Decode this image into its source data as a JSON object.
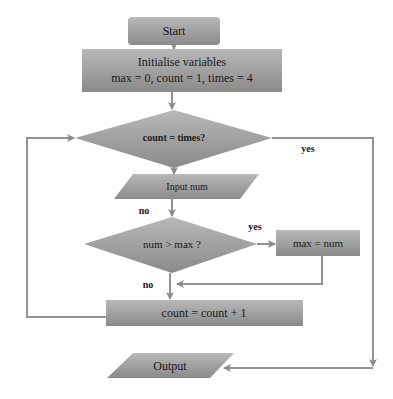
{
  "colors": {
    "shape_fill_top": "#b4b4b4",
    "shape_fill_bottom": "#8c8c8c",
    "line": "#8f8f8f",
    "text": "#1a1a1a"
  },
  "nodes": {
    "start": {
      "label": "Start",
      "shape": "rounded-rect"
    },
    "init": {
      "line1": "Initialise variables",
      "line2": "max = 0, count = 1, times = 4",
      "shape": "rect"
    },
    "cond_count": {
      "label": "count = times?",
      "shape": "diamond"
    },
    "input": {
      "label": "Input  num",
      "shape": "parallelogram"
    },
    "cond_max": {
      "label": "num > max ?",
      "shape": "diamond"
    },
    "assign_max": {
      "label": "max = num",
      "shape": "rect"
    },
    "increment": {
      "label": "count = count + 1",
      "shape": "rect"
    },
    "output": {
      "label": "Output",
      "shape": "parallelogram"
    }
  },
  "edge_labels": {
    "count_yes": "yes",
    "count_no": "no",
    "max_yes": "yes",
    "max_no": "no"
  },
  "edges": [
    {
      "from": "start",
      "to": "init"
    },
    {
      "from": "init",
      "to": "cond_count"
    },
    {
      "from": "cond_count",
      "to": "input",
      "label": "no"
    },
    {
      "from": "cond_count",
      "to": "output",
      "label": "yes"
    },
    {
      "from": "input",
      "to": "cond_max"
    },
    {
      "from": "cond_max",
      "to": "assign_max",
      "label": "yes"
    },
    {
      "from": "cond_max",
      "to": "increment",
      "label": "no"
    },
    {
      "from": "assign_max",
      "to": "increment"
    },
    {
      "from": "increment",
      "to": "cond_count"
    }
  ]
}
